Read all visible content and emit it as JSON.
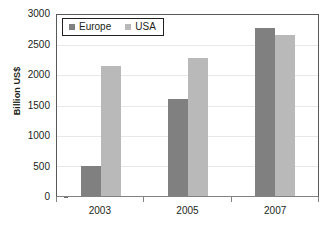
{
  "chart_data": {
    "type": "bar",
    "title": "",
    "subtitle": "",
    "xlabel": "",
    "ylabel": "Billion US$",
    "categories": [
      "2003",
      "2005",
      "2007"
    ],
    "series": [
      {
        "name": "Europe",
        "color": "#808080",
        "values": [
          490,
          1600,
          2790
        ]
      },
      {
        "name": "USA",
        "color": "#b9b9b9",
        "values": [
          2150,
          2280,
          2670
        ]
      }
    ],
    "ylim": [
      0,
      3000
    ],
    "yticks": [
      0,
      500,
      1000,
      1500,
      2000,
      2500,
      3000
    ],
    "ytick_labels": [
      "0",
      "500",
      "1000",
      "1500",
      "2000",
      "2500",
      "3000"
    ],
    "grid": true,
    "grid_axis": "y",
    "legend_position": "upper-left-inside",
    "legend_entries": [
      "Europe",
      "USA"
    ]
  },
  "axes": {
    "y_title": "Billion US$",
    "y_labels": [
      "3000",
      "2500",
      "2000",
      "1500",
      "1000",
      "500",
      "0"
    ],
    "x_labels": [
      "2003",
      "2005",
      "2007"
    ]
  },
  "legend": {
    "items": [
      {
        "label": "Europe",
        "swatch": "legend-swatch-europe"
      },
      {
        "label": "USA",
        "swatch": "legend-swatch-usa"
      }
    ]
  }
}
